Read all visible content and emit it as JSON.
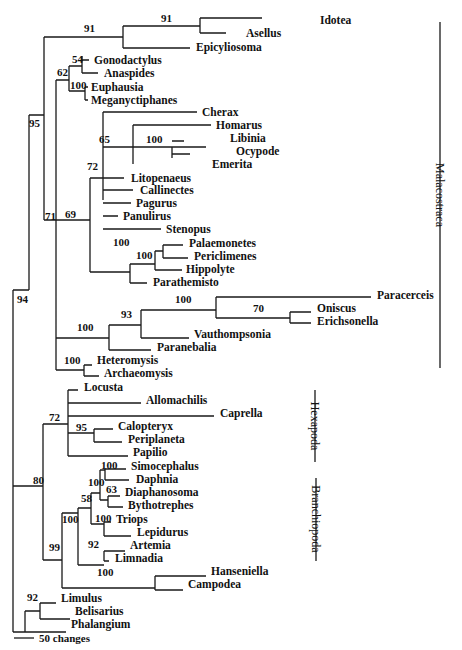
{
  "figure": {
    "type": "phylogenetic-tree",
    "scale_bar": {
      "label": "50 changes",
      "x1": 14,
      "x2": 34,
      "y": 638
    },
    "clades": [
      {
        "name": "Malacostraca",
        "x": 440,
        "y1": 22,
        "y2": 368,
        "label_y": 195
      },
      {
        "name": "Hexapoda",
        "x": 315,
        "y1": 390,
        "y2": 462,
        "label_y": 426
      },
      {
        "name": "Branchiopoda",
        "x": 316,
        "y1": 478,
        "y2": 561,
        "label_y": 519
      }
    ],
    "taxa": [
      {
        "name": "Idotea",
        "x": 320,
        "y": 20
      },
      {
        "name": "Asellus",
        "x": 246,
        "y": 33
      },
      {
        "name": "Epicyliosoma",
        "x": 196,
        "y": 47
      },
      {
        "name": "Gonodactylus",
        "x": 94,
        "y": 60
      },
      {
        "name": "Anaspides",
        "x": 104,
        "y": 73
      },
      {
        "name": "Euphausia",
        "x": 91,
        "y": 87
      },
      {
        "name": "Meganyctiphanes",
        "x": 91,
        "y": 100
      },
      {
        "name": "Cherax",
        "x": 202,
        "y": 112
      },
      {
        "name": "Homarus",
        "x": 216,
        "y": 125
      },
      {
        "name": "Libinia",
        "x": 230,
        "y": 138
      },
      {
        "name": "Ocypode",
        "x": 236,
        "y": 151
      },
      {
        "name": "Emerita",
        "x": 212,
        "y": 164
      },
      {
        "name": "Litopenaeus",
        "x": 131,
        "y": 178
      },
      {
        "name": "Callinectes",
        "x": 140,
        "y": 190
      },
      {
        "name": "Pagurus",
        "x": 136,
        "y": 203
      },
      {
        "name": "Panulirus",
        "x": 123,
        "y": 216
      },
      {
        "name": "Stenopus",
        "x": 166,
        "y": 229
      },
      {
        "name": "Palaemonetes",
        "x": 189,
        "y": 243
      },
      {
        "name": "Periclimenes",
        "x": 194,
        "y": 256
      },
      {
        "name": "Hippolyte",
        "x": 186,
        "y": 269
      },
      {
        "name": "Parathemisto",
        "x": 153,
        "y": 282
      },
      {
        "name": "Paracerceis",
        "x": 377,
        "y": 295
      },
      {
        "name": "Oniscus",
        "x": 317,
        "y": 308
      },
      {
        "name": "Erichsonella",
        "x": 317,
        "y": 321
      },
      {
        "name": "Vauthompsonia",
        "x": 194,
        "y": 334
      },
      {
        "name": "Paranebalia",
        "x": 157,
        "y": 347
      },
      {
        "name": "Heteromysis",
        "x": 97,
        "y": 360
      },
      {
        "name": "Archaeomysis",
        "x": 104,
        "y": 373
      },
      {
        "name": "Locusta",
        "x": 84,
        "y": 387
      },
      {
        "name": "Allomachilis",
        "x": 146,
        "y": 400
      },
      {
        "name": "Caprella",
        "x": 220,
        "y": 413
      },
      {
        "name": "Calopteryx",
        "x": 118,
        "y": 426
      },
      {
        "name": "Periplaneta",
        "x": 128,
        "y": 439
      },
      {
        "name": "Papilio",
        "x": 133,
        "y": 452
      },
      {
        "name": "Simocephalus",
        "x": 131,
        "y": 466
      },
      {
        "name": "Daphnia",
        "x": 136,
        "y": 479
      },
      {
        "name": "Diaphanosoma",
        "x": 125,
        "y": 492
      },
      {
        "name": "Bythotrephes",
        "x": 128,
        "y": 505
      },
      {
        "name": "Triops",
        "x": 116,
        "y": 519
      },
      {
        "name": "Lepidurus",
        "x": 137,
        "y": 532
      },
      {
        "name": "Artemia",
        "x": 130,
        "y": 545
      },
      {
        "name": "Limnadia",
        "x": 115,
        "y": 558
      },
      {
        "name": "Hanseniella",
        "x": 211,
        "y": 571
      },
      {
        "name": "Campodea",
        "x": 188,
        "y": 584
      },
      {
        "name": "Limulus",
        "x": 61,
        "y": 598
      },
      {
        "name": "Belisarius",
        "x": 75,
        "y": 611
      },
      {
        "name": "Phalangium",
        "x": 71,
        "y": 624
      }
    ],
    "bootstrap_values": [
      {
        "value": "91",
        "x": 84,
        "y": 32
      },
      {
        "value": "91",
        "x": 161,
        "y": 22
      },
      {
        "value": "54",
        "x": 72,
        "y": 63
      },
      {
        "value": "62",
        "x": 57,
        "y": 76
      },
      {
        "value": "100",
        "x": 70,
        "y": 89
      },
      {
        "value": "95",
        "x": 29,
        "y": 127
      },
      {
        "value": "65",
        "x": 99,
        "y": 143
      },
      {
        "value": "100",
        "x": 146,
        "y": 143
      },
      {
        "value": "72",
        "x": 87,
        "y": 170
      },
      {
        "value": "71",
        "x": 45,
        "y": 220
      },
      {
        "value": "69",
        "x": 65,
        "y": 218
      },
      {
        "value": "100",
        "x": 113,
        "y": 246
      },
      {
        "value": "100",
        "x": 136,
        "y": 259
      },
      {
        "value": "100",
        "x": 175,
        "y": 303
      },
      {
        "value": "70",
        "x": 253,
        "y": 312
      },
      {
        "value": "93",
        "x": 121,
        "y": 318
      },
      {
        "value": "100",
        "x": 77,
        "y": 331
      },
      {
        "value": "94",
        "x": 17,
        "y": 303
      },
      {
        "value": "100",
        "x": 64,
        "y": 364
      },
      {
        "value": "72",
        "x": 49,
        "y": 421
      },
      {
        "value": "95",
        "x": 76,
        "y": 431
      },
      {
        "value": "80",
        "x": 33,
        "y": 484
      },
      {
        "value": "100",
        "x": 101,
        "y": 469
      },
      {
        "value": "100",
        "x": 88,
        "y": 486
      },
      {
        "value": "63",
        "x": 106,
        "y": 493
      },
      {
        "value": "58",
        "x": 81,
        "y": 502
      },
      {
        "value": "100",
        "x": 95,
        "y": 522
      },
      {
        "value": "100",
        "x": 62,
        "y": 523
      },
      {
        "value": "92",
        "x": 88,
        "y": 548
      },
      {
        "value": "99",
        "x": 49,
        "y": 551
      },
      {
        "value": "100",
        "x": 97,
        "y": 576
      },
      {
        "value": "92",
        "x": 27,
        "y": 601
      }
    ],
    "branches": [
      "M44,37 H123 M123,26 V48 M123,26 H200 M200,18 V33 M200,18 H262 M200,33 H226 M123,48 H190",
      "M44,37 V115 M29,115 H44",
      "M82,60 H89 M82,73 H98 M82,56 V73 M69,66 H82",
      "M69,66 V91 M69,91 H85 M85,87 V100 M85,87 H88 M85,100 H88",
      "M56,80 H69 M56,80 V220",
      "M44,220 H56 M44,115 V220 M44,220 V220",
      "M103,112 H197 M103,112 V200",
      "M103,147 H206 M133,125 V164 M133,125 H211 M172,147 V158 M172,141 H184 M172,154 H190",
      "M103,178 H124 M103,190 H133 M103,203 H131 M103,216 H118 M103,229 H161",
      "M90,178 H103 M90,178 V272",
      "M56,220 H90",
      "M90,272 H130 M130,264 V283 M130,283 H147 M130,264 H155 M155,251 V270 M155,270 H182 M155,251 H163 M163,245 V258 M163,245 H183 M163,258 H188",
      "M56,220 V338 M56,338 H109 M109,325 V350 M109,350 H151 M109,325 H141 M141,310 V338 M141,338 H189 M141,310 H216 M216,297 V318 M216,297 H371 M216,318 H290 M290,312 V323 M290,312 H311 M290,323 H311",
      "M56,338 V370 M56,370 H84 M84,365 V376 M84,365 H92 M84,376 H99",
      "M13,290 H29 M29,115 V290",
      "M32,486 H43 M43,424 V560 M43,424 H68 M68,390 V456 M68,390 H78 M68,403 H141 M68,416 H214 M68,433 H94 M94,429 V442 M94,429 H113 M94,442 H122 M68,456 H128",
      "M13,290 V632 M13,290 V486 M13,486 H32 M32,486 V486",
      "M43,560 H62 M62,513 V588 M62,513 H78 M78,508 V565 M78,565 H104 M104,551 V561 M104,551 H125 M104,561 H109",
      "M78,508 H91 M91,493 V524 M91,493 H100 M100,470 V500 M100,470 H105 M105,469 V480 M105,469 H126 M105,480 H129 M100,500 H108 M108,496 V507 M108,496 H120 M108,507 H123 M91,524 H104 M104,522 V536 M104,522 H111 M104,536 H131",
      "M62,588 H155 M155,576 V590 M155,576 H206 M155,590 H183",
      "M13,632 H25 M25,611 V632 M25,611 H40 M40,603 V619 M40,603 H56 M40,619 H70 M25,632 H66"
    ]
  }
}
